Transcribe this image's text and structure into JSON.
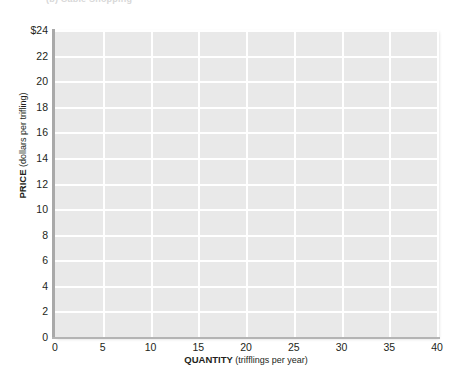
{
  "figure": {
    "caption": "(b) Cable Shopping"
  },
  "chart_data": {
    "type": "line",
    "title": "",
    "subtitle": "",
    "series": [],
    "x": [],
    "grid": true,
    "legend": null,
    "annotations": [],
    "xlabel_bold": "QUANTITY",
    "xlabel_paren": "(trifflings per year)",
    "ylabel_bold": "PRICE",
    "ylabel_paren": "(dollars per trifling)",
    "xlim": [
      0,
      40
    ],
    "ylim": [
      0,
      24
    ],
    "xticks": [
      0,
      5,
      10,
      15,
      20,
      25,
      30,
      35,
      40
    ],
    "xtick_labels": [
      "0",
      "5",
      "10",
      "15",
      "20",
      "25",
      "30",
      "35",
      "40"
    ],
    "yticks": [
      0,
      2,
      4,
      6,
      8,
      10,
      12,
      14,
      16,
      18,
      20,
      22,
      24
    ],
    "ytick_labels": [
      "0",
      "2",
      "4",
      "6",
      "8",
      "10",
      "12",
      "14",
      "16",
      "18",
      "20",
      "22",
      "$24"
    ],
    "plot_bg_color": "#e9e9e9",
    "gridline_color": "#ffffff",
    "axis_color": "#a9a9a9",
    "text_color": "#231f20"
  }
}
